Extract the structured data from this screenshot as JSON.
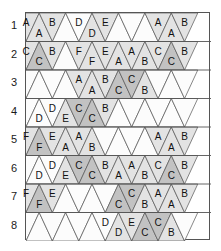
{
  "figure": {
    "type": "triangular-grid-diagram",
    "rows": 8,
    "cols": 13,
    "row_labels": [
      "1",
      "2",
      "3",
      "4",
      "5",
      "6",
      "7",
      "8"
    ],
    "colors": {
      "background": "#ffffff",
      "fill_empty": "#fcfcfc",
      "fill_light": "#e3e3e3",
      "fill_dark": "#c2c2c2",
      "stroke": "#555555",
      "row_line": "#555555",
      "text": "#111111"
    },
    "legend_note": "",
    "cells": [
      [
        {
          "label": "A",
          "shade": "light"
        },
        {
          "label": "A",
          "shade": "light"
        },
        {
          "label": "B",
          "shade": "light"
        },
        {
          "label": "",
          "shade": "empty"
        },
        {
          "label": "D",
          "shade": "empty"
        },
        {
          "label": "D",
          "shade": "light"
        },
        {
          "label": "E",
          "shade": "light"
        },
        {
          "label": "",
          "shade": "empty"
        },
        {
          "label": "",
          "shade": "empty"
        },
        {
          "label": "",
          "shade": "empty"
        },
        {
          "label": "A",
          "shade": "light"
        },
        {
          "label": "A",
          "shade": "light"
        },
        {
          "label": "B",
          "shade": "light"
        }
      ],
      [
        {
          "label": "C",
          "shade": "light"
        },
        {
          "label": "C",
          "shade": "dark"
        },
        {
          "label": "B",
          "shade": "light"
        },
        {
          "label": "",
          "shade": "empty"
        },
        {
          "label": "F",
          "shade": "light"
        },
        {
          "label": "F",
          "shade": "light"
        },
        {
          "label": "E",
          "shade": "light"
        },
        {
          "label": "A",
          "shade": "light"
        },
        {
          "label": "A",
          "shade": "light"
        },
        {
          "label": "B",
          "shade": "light"
        },
        {
          "label": "C",
          "shade": "light"
        },
        {
          "label": "C",
          "shade": "dark"
        },
        {
          "label": "B",
          "shade": "light"
        }
      ],
      [
        {
          "label": "",
          "shade": "empty"
        },
        {
          "label": "",
          "shade": "empty"
        },
        {
          "label": "",
          "shade": "empty"
        },
        {
          "label": "",
          "shade": "empty"
        },
        {
          "label": "A",
          "shade": "light"
        },
        {
          "label": "A",
          "shade": "light"
        },
        {
          "label": "B",
          "shade": "light"
        },
        {
          "label": "C",
          "shade": "dark"
        },
        {
          "label": "C",
          "shade": "dark"
        },
        {
          "label": "B",
          "shade": "light"
        },
        {
          "label": "",
          "shade": "empty"
        },
        {
          "label": "",
          "shade": "empty"
        },
        {
          "label": "",
          "shade": "empty"
        }
      ],
      [
        {
          "label": "",
          "shade": "empty"
        },
        {
          "label": "D",
          "shade": "empty"
        },
        {
          "label": "D",
          "shade": "empty"
        },
        {
          "label": "E",
          "shade": "light"
        },
        {
          "label": "C",
          "shade": "dark"
        },
        {
          "label": "C",
          "shade": "dark"
        },
        {
          "label": "B",
          "shade": "light"
        },
        {
          "label": "",
          "shade": "empty"
        },
        {
          "label": "",
          "shade": "empty"
        },
        {
          "label": "",
          "shade": "empty"
        },
        {
          "label": "",
          "shade": "empty"
        },
        {
          "label": "",
          "shade": "empty"
        },
        {
          "label": "",
          "shade": "empty"
        }
      ],
      [
        {
          "label": "F",
          "shade": "light"
        },
        {
          "label": "F",
          "shade": "dark"
        },
        {
          "label": "E",
          "shade": "light"
        },
        {
          "label": "A",
          "shade": "light"
        },
        {
          "label": "A",
          "shade": "light"
        },
        {
          "label": "B",
          "shade": "light"
        },
        {
          "label": "",
          "shade": "empty"
        },
        {
          "label": "",
          "shade": "empty"
        },
        {
          "label": "",
          "shade": "empty"
        },
        {
          "label": "",
          "shade": "empty"
        },
        {
          "label": "A",
          "shade": "light"
        },
        {
          "label": "A",
          "shade": "light"
        },
        {
          "label": "B",
          "shade": "light"
        }
      ],
      [
        {
          "label": "",
          "shade": "empty"
        },
        {
          "label": "D",
          "shade": "empty"
        },
        {
          "label": "D",
          "shade": "empty"
        },
        {
          "label": "E",
          "shade": "light"
        },
        {
          "label": "C",
          "shade": "dark"
        },
        {
          "label": "C",
          "shade": "dark"
        },
        {
          "label": "B",
          "shade": "light"
        },
        {
          "label": "A",
          "shade": "light"
        },
        {
          "label": "A",
          "shade": "light"
        },
        {
          "label": "B",
          "shade": "light"
        },
        {
          "label": "C",
          "shade": "light"
        },
        {
          "label": "C",
          "shade": "dark"
        },
        {
          "label": "B",
          "shade": "light"
        }
      ],
      [
        {
          "label": "F",
          "shade": "light"
        },
        {
          "label": "F",
          "shade": "dark"
        },
        {
          "label": "E",
          "shade": "light"
        },
        {
          "label": "",
          "shade": "empty"
        },
        {
          "label": "",
          "shade": "empty"
        },
        {
          "label": "",
          "shade": "empty"
        },
        {
          "label": "",
          "shade": "empty"
        },
        {
          "label": "C",
          "shade": "dark"
        },
        {
          "label": "C",
          "shade": "dark"
        },
        {
          "label": "B",
          "shade": "light"
        },
        {
          "label": "A",
          "shade": "light"
        },
        {
          "label": "A",
          "shade": "light"
        },
        {
          "label": "B",
          "shade": "light"
        }
      ],
      [
        {
          "label": "",
          "shade": "empty"
        },
        {
          "label": "",
          "shade": "empty"
        },
        {
          "label": "",
          "shade": "empty"
        },
        {
          "label": "",
          "shade": "empty"
        },
        {
          "label": "",
          "shade": "empty"
        },
        {
          "label": "",
          "shade": "empty"
        },
        {
          "label": "D",
          "shade": "empty"
        },
        {
          "label": "D",
          "shade": "light"
        },
        {
          "label": "E",
          "shade": "light"
        },
        {
          "label": "C",
          "shade": "dark"
        },
        {
          "label": "C",
          "shade": "dark"
        },
        {
          "label": "B",
          "shade": "light"
        },
        {
          "label": "",
          "shade": "empty"
        }
      ]
    ]
  }
}
